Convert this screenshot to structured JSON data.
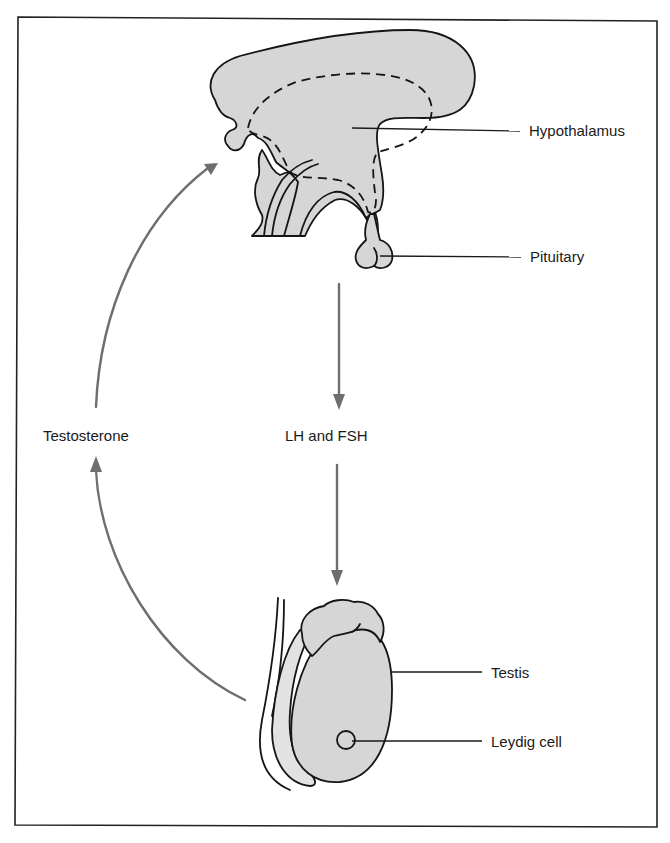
{
  "figure": {
    "colors": {
      "organ_fill": "#d6d6d6",
      "outline": "#151515",
      "arrow": "#6e6e6e",
      "text": "#1a1a1a",
      "background": "#ffffff"
    },
    "structures": [
      {
        "id": "hypothalamus",
        "label": "Hypothalamus"
      },
      {
        "id": "pituitary",
        "label": "Pituitary"
      },
      {
        "id": "testis",
        "label": "Testis"
      },
      {
        "id": "leydig",
        "label": "Leydig cell"
      }
    ],
    "signals": [
      {
        "id": "gonadotropins",
        "label": "LH and FSH",
        "from": "pituitary",
        "to": "testis"
      },
      {
        "id": "testosterone",
        "label": "Testosterone",
        "from": "testis",
        "to": "hypothalamus"
      }
    ]
  }
}
